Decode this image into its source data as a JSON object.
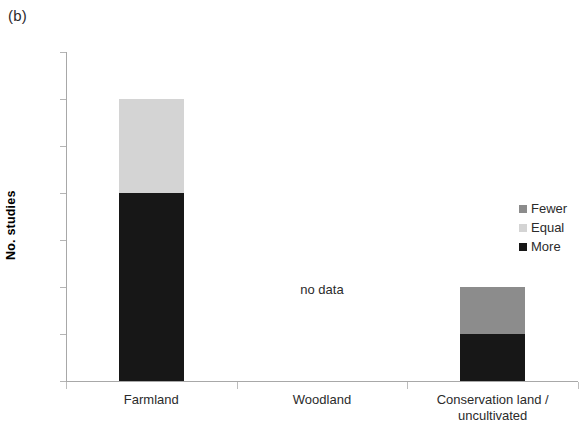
{
  "panel": {
    "label": "(b)"
  },
  "axes": {
    "y_title": "No. studies",
    "y_ticks": [
      "7",
      "6",
      "5",
      "4",
      "3",
      "2",
      "1",
      "0"
    ]
  },
  "legend": {
    "items": [
      {
        "label": "Fewer",
        "color": "#8c8c8c"
      },
      {
        "label": "Equal",
        "color": "#d4d4d4"
      },
      {
        "label": "More",
        "color": "#171717"
      }
    ]
  },
  "annotations": {
    "no_data": "no data"
  },
  "chart_data": {
    "type": "bar",
    "title": "(b)",
    "xlabel": "",
    "ylabel": "No. studies",
    "ylim": [
      0,
      7
    ],
    "ytick_step": 1,
    "grid": false,
    "stacked": true,
    "legend_position": "right",
    "categories": [
      "Farmland",
      "Woodland",
      "Conservation land / uncultivated"
    ],
    "category_labels": [
      [
        "Farmland"
      ],
      [
        "Woodland"
      ],
      [
        "Conservation land /",
        "uncultivated"
      ]
    ],
    "series": [
      {
        "name": "More",
        "color": "#171717",
        "values": [
          4,
          null,
          1
        ]
      },
      {
        "name": "Equal",
        "color": "#d4d4d4",
        "values": [
          2,
          null,
          0
        ]
      },
      {
        "name": "Fewer",
        "color": "#8c8c8c",
        "values": [
          0,
          null,
          1
        ]
      }
    ],
    "totals": [
      6,
      null,
      2
    ],
    "missing_data_categories": [
      "Woodland"
    ],
    "annotations": [
      {
        "text": "no data",
        "category": "Woodland",
        "value": 1
      }
    ]
  }
}
